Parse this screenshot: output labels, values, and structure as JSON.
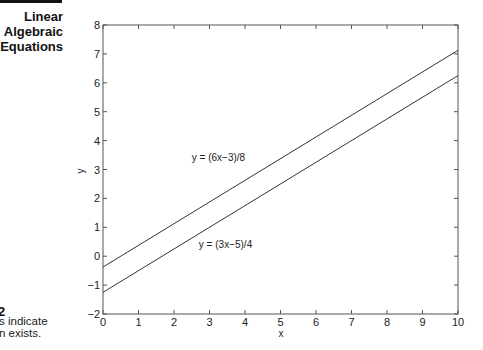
{
  "sidebar": {
    "section_title_line1": "Linear",
    "section_title_line2": "Algebraic",
    "section_title_line3": "Equations",
    "figure_number": "2",
    "caption_line1": "s indicate",
    "caption_line2": "n exists."
  },
  "chart_data": {
    "type": "line",
    "title": "",
    "xlabel": "x",
    "ylabel": "y",
    "xlim": [
      0,
      10
    ],
    "ylim": [
      -2,
      8
    ],
    "xticks": [
      0,
      1,
      2,
      3,
      4,
      5,
      6,
      7,
      8,
      9,
      10
    ],
    "yticks": [
      -2,
      -1,
      0,
      1,
      2,
      3,
      4,
      5,
      6,
      7,
      8
    ],
    "grid": false,
    "legend": "none",
    "series": [
      {
        "name": "y = (6x−3)/8",
        "x": [
          0,
          10
        ],
        "y": [
          -0.375,
          7.125
        ]
      },
      {
        "name": "y = (3x−5)/4",
        "x": [
          0,
          10
        ],
        "y": [
          -1.25,
          6.25
        ]
      }
    ],
    "annotations": [
      {
        "text": "y = (6x−3)/8",
        "x": 2.5,
        "y": 3.3
      },
      {
        "text": "y = (3x−5)/4",
        "x": 2.7,
        "y": 0.3
      }
    ]
  },
  "colors": {
    "line": "#333333",
    "axis": "#555555",
    "text": "#222222"
  }
}
